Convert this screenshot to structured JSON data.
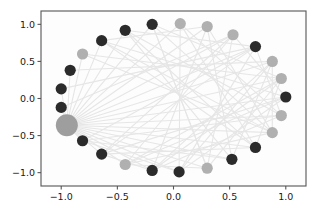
{
  "figure": {
    "background_color": "#ffffff",
    "axes_frame_color": "#555555",
    "edge_color": "#e6e6e6",
    "node_dark_color": "#2b2b2b",
    "node_light_color": "#b0b0b0",
    "hub_color": "#9e9e9e"
  },
  "axes": {
    "x_ticks": [
      "-1.0",
      "-0.5",
      "0.0",
      "0.5",
      "1.0"
    ],
    "x_tick_values": [
      -1.0,
      -0.5,
      0.0,
      0.5,
      1.0
    ],
    "y_ticks": [
      "1.0",
      "0.5",
      "0.0",
      "-0.5",
      "-1.0"
    ],
    "y_tick_values": [
      1.0,
      0.5,
      0.0,
      -0.5,
      -1.0
    ],
    "xlim": [
      -1.18,
      1.18
    ],
    "ylim": [
      -1.18,
      1.18
    ],
    "xlabel": "",
    "ylabel": "",
    "title": ""
  },
  "chart_data": {
    "type": "scatter",
    "title": "",
    "xlabel": "",
    "ylabel": "",
    "xlim": [
      -1.18,
      1.18
    ],
    "ylim": [
      -1.18,
      1.18
    ],
    "grid": false,
    "legend": "none",
    "layout": "circular",
    "nodes": [
      {
        "id": 0,
        "x": -0.95,
        "y": -0.36,
        "color": "#9e9e9e",
        "size": 11.0,
        "role": "hub"
      },
      {
        "id": 1,
        "x": -1.0,
        "y": -0.12,
        "color": "#2b2b2b",
        "size": 5.6,
        "role": "peripheral"
      },
      {
        "id": 2,
        "x": -1.0,
        "y": 0.13,
        "color": "#2b2b2b",
        "size": 5.6,
        "role": "peripheral"
      },
      {
        "id": 3,
        "x": -0.92,
        "y": 0.38,
        "color": "#2b2b2b",
        "size": 5.6,
        "role": "peripheral"
      },
      {
        "id": 4,
        "x": -0.81,
        "y": 0.6,
        "color": "#b0b0b0",
        "size": 5.6,
        "role": "peripheral"
      },
      {
        "id": 5,
        "x": -0.64,
        "y": 0.78,
        "color": "#2b2b2b",
        "size": 5.6,
        "role": "peripheral"
      },
      {
        "id": 6,
        "x": -0.43,
        "y": 0.92,
        "color": "#2b2b2b",
        "size": 5.6,
        "role": "peripheral"
      },
      {
        "id": 7,
        "x": -0.19,
        "y": 1.0,
        "color": "#2b2b2b",
        "size": 5.6,
        "role": "peripheral"
      },
      {
        "id": 8,
        "x": 0.06,
        "y": 1.01,
        "color": "#b0b0b0",
        "size": 5.6,
        "role": "peripheral"
      },
      {
        "id": 9,
        "x": 0.3,
        "y": 0.97,
        "color": "#b0b0b0",
        "size": 5.6,
        "role": "peripheral"
      },
      {
        "id": 10,
        "x": 0.53,
        "y": 0.86,
        "color": "#b0b0b0",
        "size": 5.6,
        "role": "peripheral"
      },
      {
        "id": 11,
        "x": 0.73,
        "y": 0.7,
        "color": "#2b2b2b",
        "size": 5.6,
        "role": "peripheral"
      },
      {
        "id": 12,
        "x": 0.88,
        "y": 0.5,
        "color": "#b0b0b0",
        "size": 5.6,
        "role": "peripheral"
      },
      {
        "id": 13,
        "x": 0.96,
        "y": 0.27,
        "color": "#b0b0b0",
        "size": 5.6,
        "role": "peripheral"
      },
      {
        "id": 14,
        "x": 1.0,
        "y": 0.02,
        "color": "#2b2b2b",
        "size": 5.6,
        "role": "peripheral"
      },
      {
        "id": 15,
        "x": 0.96,
        "y": -0.23,
        "color": "#b0b0b0",
        "size": 5.6,
        "role": "peripheral"
      },
      {
        "id": 16,
        "x": 0.88,
        "y": -0.46,
        "color": "#b0b0b0",
        "size": 5.6,
        "role": "peripheral"
      },
      {
        "id": 17,
        "x": 0.73,
        "y": -0.66,
        "color": "#2b2b2b",
        "size": 5.6,
        "role": "peripheral"
      },
      {
        "id": 18,
        "x": 0.52,
        "y": -0.82,
        "color": "#2b2b2b",
        "size": 5.6,
        "role": "peripheral"
      },
      {
        "id": 19,
        "x": 0.3,
        "y": -0.94,
        "color": "#b0b0b0",
        "size": 5.6,
        "role": "peripheral"
      },
      {
        "id": 20,
        "x": 0.05,
        "y": -0.99,
        "color": "#2b2b2b",
        "size": 5.6,
        "role": "peripheral"
      },
      {
        "id": 21,
        "x": -0.19,
        "y": -0.97,
        "color": "#2b2b2b",
        "size": 5.6,
        "role": "peripheral"
      },
      {
        "id": 22,
        "x": -0.43,
        "y": -0.89,
        "color": "#b0b0b0",
        "size": 5.6,
        "role": "peripheral"
      },
      {
        "id": 23,
        "x": -0.64,
        "y": -0.75,
        "color": "#2b2b2b",
        "size": 5.6,
        "role": "peripheral"
      },
      {
        "id": 24,
        "x": -0.81,
        "y": -0.57,
        "color": "#2b2b2b",
        "size": 5.6,
        "role": "peripheral"
      }
    ],
    "edges": [
      [
        0,
        1
      ],
      [
        0,
        2
      ],
      [
        0,
        3
      ],
      [
        0,
        4
      ],
      [
        0,
        5
      ],
      [
        0,
        6
      ],
      [
        0,
        7
      ],
      [
        0,
        8
      ],
      [
        0,
        9
      ],
      [
        0,
        10
      ],
      [
        0,
        11
      ],
      [
        0,
        12
      ],
      [
        0,
        13
      ],
      [
        0,
        14
      ],
      [
        0,
        15
      ],
      [
        0,
        16
      ],
      [
        0,
        17
      ],
      [
        0,
        18
      ],
      [
        0,
        19
      ],
      [
        0,
        20
      ],
      [
        0,
        21
      ],
      [
        0,
        22
      ],
      [
        0,
        23
      ],
      [
        0,
        24
      ],
      [
        5,
        14
      ],
      [
        5,
        17
      ],
      [
        6,
        15
      ],
      [
        6,
        18
      ],
      [
        7,
        16
      ],
      [
        7,
        19
      ],
      [
        8,
        17
      ],
      [
        8,
        20
      ],
      [
        9,
        18
      ],
      [
        9,
        21
      ],
      [
        10,
        19
      ],
      [
        10,
        22
      ],
      [
        11,
        20
      ],
      [
        11,
        23
      ],
      [
        12,
        21
      ],
      [
        12,
        18
      ],
      [
        13,
        22
      ],
      [
        13,
        19
      ],
      [
        14,
        23
      ],
      [
        14,
        20
      ],
      [
        15,
        24
      ],
      [
        15,
        21
      ],
      [
        16,
        22
      ],
      [
        16,
        5
      ],
      [
        17,
        23
      ],
      [
        17,
        6
      ],
      [
        18,
        24
      ],
      [
        19,
        7
      ],
      [
        20,
        12
      ],
      [
        21,
        13
      ],
      [
        22,
        14
      ],
      [
        23,
        10
      ],
      [
        24,
        11
      ],
      [
        4,
        13
      ],
      [
        4,
        16
      ],
      [
        3,
        12
      ],
      [
        2,
        11
      ],
      [
        1,
        10
      ],
      [
        5,
        9
      ],
      [
        6,
        11
      ],
      [
        7,
        13
      ],
      [
        8,
        15
      ],
      [
        9,
        16
      ],
      [
        10,
        14
      ],
      [
        20,
        24
      ],
      [
        21,
        23
      ],
      [
        19,
        22
      ],
      [
        12,
        16
      ],
      [
        13,
        17
      ],
      [
        11,
        15
      ]
    ]
  }
}
